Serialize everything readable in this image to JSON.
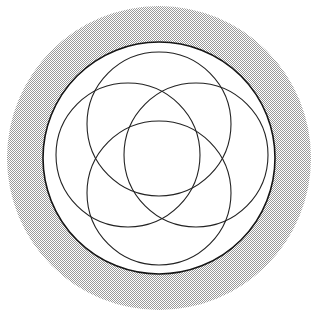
{
  "figure": {
    "title": "Four overlapping circles inscribed in a circle on a shaded disc",
    "caption": "",
    "background_color": "#ffffff",
    "canvas": {
      "width": 321,
      "height": 316
    }
  },
  "shaded_disc": {
    "name": "shaded-background-disc",
    "center_x": 159,
    "center_y": 158,
    "radius": 152,
    "fill_color": "#9a9a9a",
    "fill_style": "50% checkerboard dither",
    "dither_cell_px": 2,
    "stroke": "none"
  },
  "outer_circle": {
    "name": "outer-bounding-circle",
    "center_x": 159,
    "center_y": 158,
    "radius": 116,
    "stroke_color": "#141414",
    "stroke_width": 1.6,
    "fill_color": "#ffffff"
  },
  "inner_circles": [
    {
      "label": "top-circle",
      "center_x": 159,
      "center_y": 124,
      "radius": 72,
      "stroke_color": "#222222",
      "stroke_width": 1.1
    },
    {
      "label": "left-circle",
      "center_x": 128,
      "center_y": 155,
      "radius": 72,
      "stroke_color": "#222222",
      "stroke_width": 1.1
    },
    {
      "label": "right-circle",
      "center_x": 196,
      "center_y": 155,
      "radius": 72,
      "stroke_color": "#222222",
      "stroke_width": 1.1
    },
    {
      "label": "bottom-circle",
      "center_x": 159,
      "center_y": 193,
      "radius": 72,
      "stroke_color": "#222222",
      "stroke_width": 1.1
    }
  ],
  "palette": {
    "ink": "#141414",
    "line": "#222222",
    "shade": "#9a9a9a",
    "paper": "#ffffff"
  }
}
